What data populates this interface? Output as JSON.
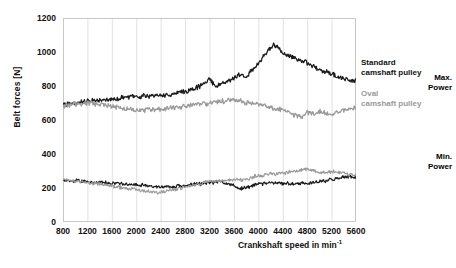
{
  "chart_data": {
    "type": "line",
    "title": "",
    "xlabel": "Crankshaft speed in min-1",
    "xlabel_base": "Crankshaft speed in min",
    "xlabel_exponent": "-1",
    "ylabel": "Belt forces  [N]",
    "xlim": [
      800,
      5600
    ],
    "ylim": [
      0,
      1200
    ],
    "xticks": [
      800,
      1200,
      1600,
      2000,
      2400,
      2800,
      3200,
      3600,
      4000,
      4400,
      4800,
      5200,
      5600
    ],
    "yticks": [
      0,
      200,
      400,
      600,
      800,
      1000,
      1200
    ],
    "grid": "vertical light-gray gridlines at each x tick, plot frame outlined",
    "legend_position": "right-outside",
    "colors": {
      "standard": "#1a1a1a",
      "oval": "#9a9a9a",
      "grid": "#d9d9d9",
      "frame": "#c8c8c8"
    },
    "annotations": [
      {
        "text": "Max.",
        "bold": true
      },
      {
        "text": "Power",
        "bold": true
      },
      {
        "text": "Min.",
        "bold": true
      },
      {
        "text": "Power",
        "bold": true
      }
    ],
    "series": [
      {
        "name": "Standard camshaft pulley - Max. Power",
        "color": "#1a1a1a",
        "group": "max",
        "x": [
          800,
          1000,
          1200,
          1400,
          1600,
          1800,
          2000,
          2200,
          2400,
          2600,
          2800,
          3000,
          3100,
          3200,
          3300,
          3400,
          3600,
          3700,
          3800,
          3900,
          4000,
          4100,
          4200,
          4250,
          4300,
          4400,
          4500,
          4600,
          4700,
          4800,
          4900,
          5000,
          5100,
          5200,
          5300,
          5400,
          5500,
          5600
        ],
        "y": [
          690,
          700,
          712,
          715,
          720,
          730,
          738,
          742,
          745,
          752,
          768,
          790,
          815,
          840,
          800,
          812,
          845,
          870,
          855,
          900,
          935,
          985,
          1025,
          1040,
          1030,
          995,
          975,
          965,
          950,
          935,
          915,
          900,
          885,
          870,
          855,
          843,
          835,
          830
        ]
      },
      {
        "name": "Oval camshaft pulley - Max. Power",
        "color": "#9a9a9a",
        "group": "max",
        "x": [
          800,
          1000,
          1200,
          1400,
          1600,
          1800,
          2000,
          2200,
          2400,
          2600,
          2800,
          3000,
          3200,
          3400,
          3600,
          3700,
          3800,
          4000,
          4200,
          4400,
          4600,
          4700,
          4800,
          4900,
          5000,
          5100,
          5200,
          5300,
          5400,
          5500,
          5600
        ],
        "y": [
          685,
          695,
          700,
          692,
          680,
          668,
          662,
          660,
          665,
          672,
          680,
          690,
          700,
          710,
          718,
          712,
          700,
          690,
          672,
          660,
          628,
          618,
          645,
          638,
          650,
          640,
          632,
          648,
          660,
          672,
          672
        ]
      },
      {
        "name": "Standard camshaft pulley - Min. Power",
        "color": "#1a1a1a",
        "group": "min",
        "x": [
          800,
          1000,
          1200,
          1400,
          1600,
          1800,
          2000,
          2200,
          2400,
          2600,
          2800,
          3000,
          3200,
          3400,
          3500,
          3600,
          3700,
          3800,
          4000,
          4200,
          4400,
          4600,
          4800,
          5000,
          5200,
          5300,
          5400,
          5500,
          5600
        ],
        "y": [
          250,
          242,
          235,
          232,
          228,
          224,
          220,
          212,
          205,
          208,
          215,
          222,
          232,
          238,
          225,
          212,
          195,
          205,
          222,
          230,
          228,
          226,
          230,
          236,
          248,
          258,
          265,
          268,
          262
        ]
      },
      {
        "name": "Oval camshaft pulley - Min. Power",
        "color": "#9a9a9a",
        "group": "min",
        "x": [
          800,
          1000,
          1200,
          1400,
          1600,
          1800,
          2000,
          2200,
          2400,
          2600,
          2800,
          3000,
          3200,
          3400,
          3600,
          3700,
          3800,
          4000,
          4200,
          4400,
          4600,
          4800,
          4900,
          5000,
          5200,
          5400,
          5500,
          5600
        ],
        "y": [
          252,
          240,
          232,
          225,
          212,
          200,
          190,
          178,
          175,
          190,
          205,
          222,
          240,
          242,
          250,
          248,
          252,
          272,
          282,
          288,
          298,
          312,
          305,
          290,
          295,
          288,
          278,
          275
        ]
      }
    ]
  },
  "legend": {
    "standard_line1": "Standard",
    "standard_line2": "camshaft pulley",
    "oval_line1": "Oval",
    "oval_line2": "camshaft pulley",
    "max_line1": "Max.",
    "max_line2": "Power",
    "min_line1": "Min.",
    "min_line2": "Power"
  },
  "axes": {
    "y_title": "Belt forces  [N]",
    "x_title_base": "Crankshaft speed in min",
    "x_title_sup": "-1",
    "y_ticks": [
      "0",
      "200",
      "400",
      "600",
      "800",
      "1000",
      "1200"
    ],
    "x_ticks": [
      "800",
      "1200",
      "1600",
      "2000",
      "2400",
      "2800",
      "3200",
      "3600",
      "4000",
      "4400",
      "4800",
      "5200",
      "5600"
    ]
  }
}
